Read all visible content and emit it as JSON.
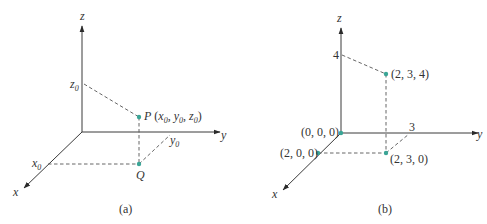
{
  "panel_a": {
    "caption": "(a)",
    "axes": {
      "x": "x",
      "y": "y",
      "z": "z"
    },
    "labels": {
      "z0": "z",
      "z0_sub": "0",
      "x0": "x",
      "x0_sub": "0",
      "y0": "y",
      "y0_sub": "0",
      "P": "P",
      "P_coords_open": " (",
      "P_x": "x",
      "P_y": "y",
      "P_z": "z",
      "sub0": "0",
      "comma": ", ",
      "close": ")",
      "Q": "Q"
    },
    "point_color": "#3aa596"
  },
  "panel_b": {
    "caption": "(b)",
    "axes": {
      "x": "x",
      "y": "y",
      "z": "z"
    },
    "ticks": {
      "z": "4",
      "y": "3"
    },
    "points": [
      {
        "label": "(0, 0, 0)"
      },
      {
        "label": "(2, 0, 0)"
      },
      {
        "label": "(2, 3, 0)"
      },
      {
        "label": "(2, 3, 4)"
      }
    ],
    "point_color": "#3aa596"
  }
}
